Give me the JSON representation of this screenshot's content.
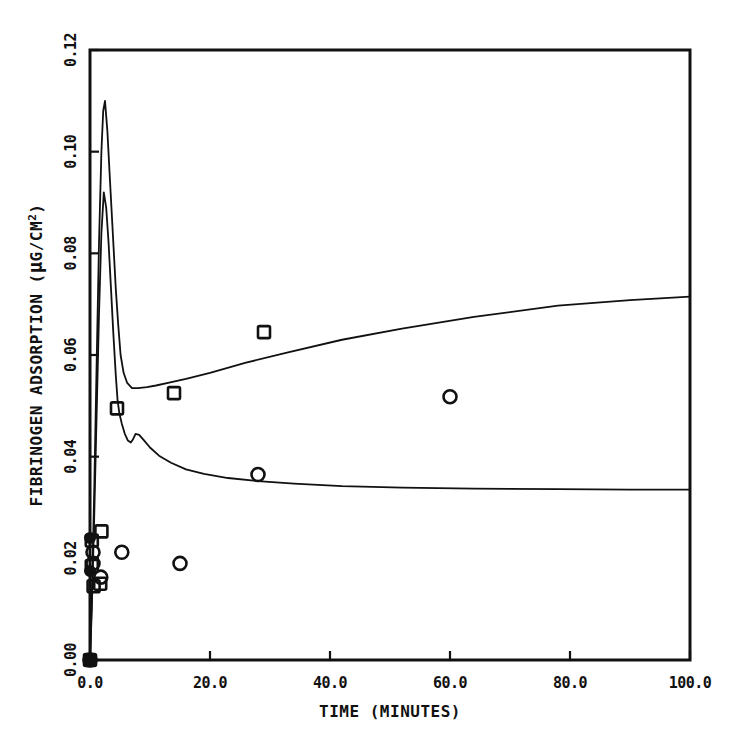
{
  "chart_data": {
    "type": "line",
    "title": "",
    "xlabel": "TIME (MINUTES)",
    "ylabel": "FIBRINOGEN ADSORPTION (µG/CM²)",
    "ylabel_main": "FIBRINOGEN ADSORPTION (",
    "ylabel_mu": "µ",
    "ylabel_units": "G/CM",
    "ylabel_exp": "2",
    "ylabel_close": ")",
    "xlim": [
      0,
      100
    ],
    "ylim": [
      0.0,
      0.12
    ],
    "grid": false,
    "legend": "none",
    "xticks": [
      0,
      20,
      40,
      60,
      80,
      100
    ],
    "xtick_labels": [
      "0.0",
      "20.0",
      "40.0",
      "60.0",
      "80.0",
      "100.0"
    ],
    "yticks": [
      0.0,
      0.02,
      0.04,
      0.06,
      0.08,
      0.1,
      0.12
    ],
    "ytick_labels": [
      "0.00",
      "0.02",
      "0.04",
      "0.06",
      "0.08",
      "0.10",
      "0.12"
    ],
    "series": [
      {
        "name": "upper-curve",
        "style": "line",
        "x": [
          0.0,
          0.3,
          0.7,
          1.1,
          1.5,
          1.9,
          2.2,
          2.5,
          2.9,
          3.3,
          3.8,
          4.3,
          4.7,
          5.1,
          5.6,
          6.2,
          7.0,
          8.0,
          9.5,
          11.0,
          13.0,
          16.0,
          20.0,
          26.0,
          33.0,
          42.0,
          52.0,
          64.0,
          78.0,
          90.0,
          100.0
        ],
        "y": [
          0.0,
          0.012,
          0.033,
          0.058,
          0.082,
          0.1,
          0.108,
          0.11,
          0.104,
          0.095,
          0.084,
          0.073,
          0.066,
          0.06,
          0.0565,
          0.0545,
          0.0535,
          0.0535,
          0.0537,
          0.054,
          0.0545,
          0.0553,
          0.0565,
          0.0585,
          0.0605,
          0.063,
          0.0652,
          0.0675,
          0.0697,
          0.0708,
          0.0715
        ]
      },
      {
        "name": "lower-curve",
        "style": "line",
        "x": [
          0.0,
          0.3,
          0.7,
          1.1,
          1.5,
          1.9,
          2.3,
          2.7,
          3.1,
          3.5,
          3.9,
          4.3,
          4.6,
          4.9,
          5.3,
          5.8,
          6.3,
          6.8,
          7.2,
          7.6,
          8.2,
          9.0,
          10.0,
          11.5,
          13.5,
          16.0,
          19.0,
          23.0,
          28.0,
          34.0,
          42.0,
          52.0,
          64.0,
          78.0,
          90.0,
          100.0
        ],
        "y": [
          0.0,
          0.01,
          0.028,
          0.048,
          0.068,
          0.084,
          0.092,
          0.089,
          0.082,
          0.073,
          0.064,
          0.056,
          0.051,
          0.0485,
          0.0465,
          0.0445,
          0.0432,
          0.0428,
          0.0435,
          0.0445,
          0.0443,
          0.0432,
          0.0418,
          0.0402,
          0.0388,
          0.0375,
          0.0366,
          0.0358,
          0.0352,
          0.0347,
          0.0342,
          0.0339,
          0.0337,
          0.0336,
          0.0335,
          0.0335
        ]
      },
      {
        "name": "square-data-points",
        "style": "scatter",
        "marker": "open-square",
        "points": [
          {
            "x": 0.0,
            "y": 0.0
          },
          {
            "x": 0.3,
            "y": 0.0235
          },
          {
            "x": 1.9,
            "y": 0.0253
          },
          {
            "x": 0.3,
            "y": 0.0185
          },
          {
            "x": 0.6,
            "y": 0.0145
          },
          {
            "x": 1.7,
            "y": 0.015
          },
          {
            "x": 4.5,
            "y": 0.0495
          },
          {
            "x": 14.0,
            "y": 0.0525
          },
          {
            "x": 29.0,
            "y": 0.0645
          }
        ]
      },
      {
        "name": "circle-data-points",
        "style": "scatter",
        "marker": "open-circle",
        "points": [
          {
            "x": 0.0,
            "y": 0.0
          },
          {
            "x": 0.5,
            "y": 0.0212
          },
          {
            "x": 0.5,
            "y": 0.019
          },
          {
            "x": 5.3,
            "y": 0.0212
          },
          {
            "x": 1.8,
            "y": 0.0163
          },
          {
            "x": 15.0,
            "y": 0.019
          },
          {
            "x": 28.0,
            "y": 0.0365
          },
          {
            "x": 60.0,
            "y": 0.0518
          }
        ]
      },
      {
        "name": "filled-origin-points",
        "style": "scatter",
        "marker": "filled-circle",
        "points": [
          {
            "x": 0.0,
            "y": 0.0
          },
          {
            "x": 0.0,
            "y": 0.024
          },
          {
            "x": 0.0,
            "y": 0.0175
          }
        ]
      }
    ]
  }
}
